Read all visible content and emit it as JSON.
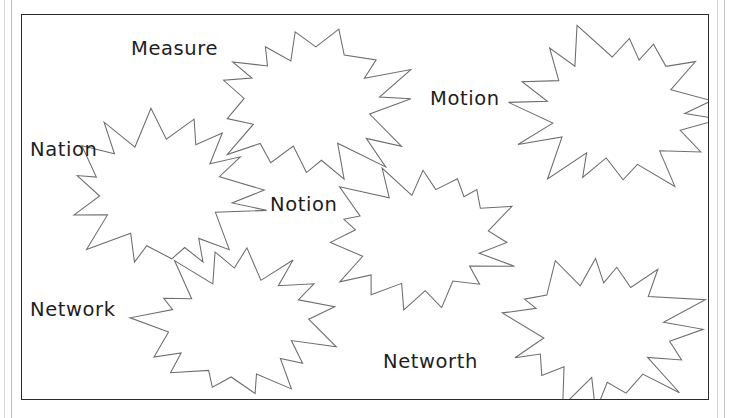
{
  "page": {
    "background_color": "#ffffff",
    "frame_color": "#2b2b2b",
    "burst_outline_color": "#6c6c6c",
    "burst_fill_color": "#ffffff",
    "text_color": "#1e1e1e"
  },
  "labels": [
    {
      "text": "Measure",
      "x": 131,
      "y": 39,
      "for_burst": "burst-measure"
    },
    {
      "text": "Motion",
      "x": 430,
      "y": 89,
      "for_burst": "burst-motion"
    },
    {
      "text": "Nation",
      "x": 30,
      "y": 140,
      "for_burst": "burst-nation"
    },
    {
      "text": "Notion",
      "x": 270,
      "y": 195,
      "for_burst": "burst-notion"
    },
    {
      "text": "Network",
      "x": 30,
      "y": 300,
      "for_burst": "burst-network"
    },
    {
      "text": "Networth",
      "x": 383,
      "y": 352,
      "for_burst": "burst-networth"
    }
  ],
  "bursts": [
    {
      "name": "burst-measure",
      "label": "Measure",
      "center_x": 311,
      "center_y": 103,
      "radius_outer": 93,
      "radius_inner": 62,
      "points": 15
    },
    {
      "name": "burst-motion",
      "label": "Motion",
      "center_x": 615,
      "center_y": 110,
      "radius_outer": 95,
      "radius_inner": 63,
      "points": 15
    },
    {
      "name": "burst-nation",
      "label": "Nation",
      "center_x": 165,
      "center_y": 192,
      "radius_outer": 92,
      "radius_inner": 61,
      "points": 15
    },
    {
      "name": "burst-notion",
      "label": "Notion",
      "center_x": 423,
      "center_y": 238,
      "radius_outer": 90,
      "radius_inner": 60,
      "points": 15
    },
    {
      "name": "burst-network",
      "label": "Network",
      "center_x": 238,
      "center_y": 323,
      "radius_outer": 90,
      "radius_inner": 60,
      "points": 15
    },
    {
      "name": "burst-networth",
      "label": "Networth",
      "center_x": 602,
      "center_y": 331,
      "radius_outer": 92,
      "radius_inner": 61,
      "points": 15
    }
  ],
  "frame": {
    "left": 21,
    "top": 14,
    "width": 688,
    "height": 386
  }
}
